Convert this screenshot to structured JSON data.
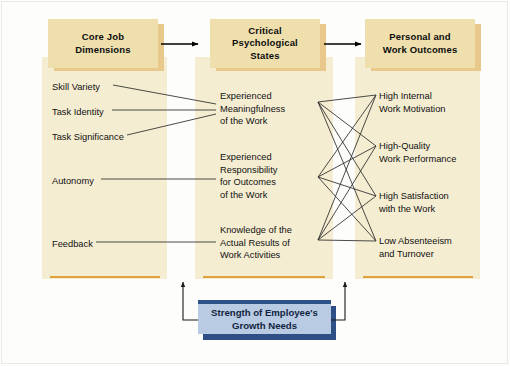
{
  "diagram": {
    "colors": {
      "panel_fill": "#f5edd2",
      "tab_fill": "#eedfad",
      "tab_shadow": "#e8c98b",
      "panel_rule": "#e0a03c",
      "moderator_fill": "#b9cbe2",
      "moderator_accent": "#2d5288",
      "connector": "#2b2b2b"
    },
    "columns": [
      {
        "id": "core-job-dimensions",
        "header": "Core Job\nDimensions",
        "header_line1": "Core Job",
        "header_line2": "Dimensions",
        "items": [
          {
            "id": "skill-variety",
            "lines": [
              "Skill Variety"
            ]
          },
          {
            "id": "task-identity",
            "lines": [
              "Task Identity"
            ]
          },
          {
            "id": "task-significance",
            "lines": [
              "Task Significance"
            ]
          },
          {
            "id": "autonomy",
            "lines": [
              "Autonomy"
            ]
          },
          {
            "id": "feedback",
            "lines": [
              "Feedback"
            ]
          }
        ]
      },
      {
        "id": "critical-psychological-states",
        "header": "Critical\nPsychological\nStates",
        "header_line1": "Critical",
        "header_line2": "Psychological",
        "header_line3": "States",
        "items": [
          {
            "id": "experienced-meaningfulness",
            "lines": [
              "Experienced",
              "Meaningfulness",
              "of the Work"
            ]
          },
          {
            "id": "experienced-responsibility",
            "lines": [
              "Experienced",
              "Responsibility",
              "for Outcomes",
              "of the Work"
            ]
          },
          {
            "id": "knowledge-of-results",
            "lines": [
              "Knowledge of the",
              "Actual Results of",
              "Work Activities"
            ]
          }
        ]
      },
      {
        "id": "personal-and-work-outcomes",
        "header": "Personal and\nWork Outcomes",
        "header_line1": "Personal and",
        "header_line2": "Work Outcomes",
        "items": [
          {
            "id": "high-internal-work-motivation",
            "lines": [
              "High Internal",
              "Work Motivation"
            ]
          },
          {
            "id": "high-quality-work-performance",
            "lines": [
              "High-Quality",
              "Work Performance"
            ]
          },
          {
            "id": "high-satisfaction-with-work",
            "lines": [
              "High Satisfaction",
              "with the Work"
            ]
          },
          {
            "id": "low-absenteeism-and-turnover",
            "lines": [
              "Low Absenteeism",
              "and Turnover"
            ]
          }
        ]
      }
    ],
    "moderator": {
      "id": "strength-of-employees-growth-needs",
      "line1": "Strength of Employee's",
      "line2": "Growth Needs"
    },
    "links": {
      "dimensions_to_states": [
        {
          "from": "skill-variety",
          "to": "experienced-meaningfulness"
        },
        {
          "from": "task-identity",
          "to": "experienced-meaningfulness"
        },
        {
          "from": "task-significance",
          "to": "experienced-meaningfulness"
        },
        {
          "from": "autonomy",
          "to": "experienced-responsibility"
        },
        {
          "from": "feedback",
          "to": "knowledge-of-results"
        }
      ],
      "states_to_outcomes": [
        {
          "from": "experienced-meaningfulness",
          "to": "high-internal-work-motivation"
        },
        {
          "from": "experienced-meaningfulness",
          "to": "high-quality-work-performance"
        },
        {
          "from": "experienced-meaningfulness",
          "to": "high-satisfaction-with-work"
        },
        {
          "from": "experienced-meaningfulness",
          "to": "low-absenteeism-and-turnover"
        },
        {
          "from": "experienced-responsibility",
          "to": "high-internal-work-motivation"
        },
        {
          "from": "experienced-responsibility",
          "to": "high-quality-work-performance"
        },
        {
          "from": "experienced-responsibility",
          "to": "high-satisfaction-with-work"
        },
        {
          "from": "experienced-responsibility",
          "to": "low-absenteeism-and-turnover"
        },
        {
          "from": "knowledge-of-results",
          "to": "high-internal-work-motivation"
        },
        {
          "from": "knowledge-of-results",
          "to": "high-quality-work-performance"
        },
        {
          "from": "knowledge-of-results",
          "to": "high-satisfaction-with-work"
        },
        {
          "from": "knowledge-of-results",
          "to": "low-absenteeism-and-turnover"
        }
      ],
      "moderator_targets": [
        "core-job-dimensions",
        "critical-psychological-states"
      ]
    }
  }
}
